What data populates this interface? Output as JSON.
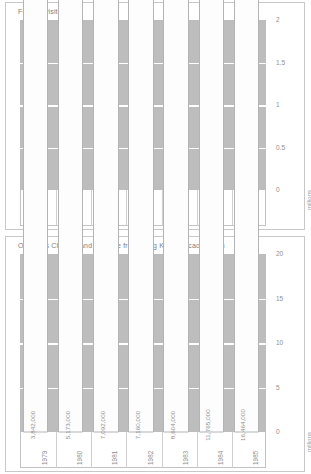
{
  "chart_data": [
    {
      "type": "bar",
      "title": "Foreign visitors",
      "xlabel": "",
      "ylabel": "millions",
      "unit_label": "millions",
      "ylim": [
        0,
        2
      ],
      "yticks": [
        "0",
        "0.5",
        "1",
        "1.5",
        "2"
      ],
      "ytick_values": [
        0,
        0.5,
        1,
        1.5,
        2
      ],
      "grid": true,
      "legend": "none",
      "categories": [
        "1979",
        "1980",
        "1981",
        "1982",
        "1983",
        "1984",
        "1985"
      ],
      "values": [
        362000,
        529000,
        675000,
        765000,
        873000,
        1134000,
        1370000
      ],
      "value_labels": [
        "362,000",
        "529,000",
        "675,000",
        "765,000",
        "873,000",
        "1,134,000",
        "1,370,000"
      ]
    },
    {
      "type": "bar",
      "title": "Overseas Chinese and Chinese from Hong Kong/Macao/Taiwan",
      "xlabel": "",
      "ylabel": "millions",
      "unit_label": "millions",
      "ylim": [
        0,
        20
      ],
      "yticks": [
        "0",
        "5",
        "10",
        "15",
        "20"
      ],
      "ytick_values": [
        0,
        5,
        10,
        15,
        20
      ],
      "grid": true,
      "legend": "none",
      "categories": [
        "1979",
        "1980",
        "1981",
        "1982",
        "1983",
        "1984",
        "1985"
      ],
      "values": [
        3842000,
        5173000,
        7092000,
        7160000,
        8604000,
        11765000,
        16464000
      ],
      "value_labels": [
        "3,842,000",
        "5,173,000",
        "7,092,000",
        "7,160,000",
        "8,604,000",
        "11,765,000",
        "16,464,000"
      ]
    }
  ],
  "colors": {
    "plot_background": "#bdbdbd",
    "gridline": "#ffffff",
    "bar_front": "#fdfdfd",
    "bar_side": "#e2e2e2",
    "bar_top": "#ededed",
    "bar_outline": "#b4b4b4",
    "text": "#8f8f8f",
    "panel_border": "#c8c8c8"
  }
}
